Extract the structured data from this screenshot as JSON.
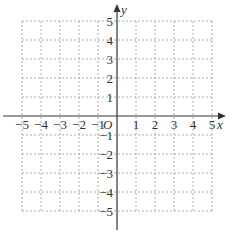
{
  "chart_data": {
    "type": "scatter",
    "title": "",
    "xlabel": "x",
    "ylabel": "y",
    "origin_label": "O",
    "xlim": [
      -5,
      5
    ],
    "ylim": [
      -5,
      5
    ],
    "grid": true,
    "grid_style": "dashed",
    "x_ticks": [
      "-5",
      "-4",
      "-3",
      "-2",
      "-1",
      "1",
      "2",
      "3",
      "4",
      "5"
    ],
    "y_ticks": [
      "5",
      "4",
      "3",
      "2",
      "1",
      "-1",
      "-2",
      "-3",
      "-4",
      "-5"
    ],
    "series": []
  },
  "colors": {
    "axis": "#333333",
    "grid": "#9a9a9a",
    "text": "#333333"
  }
}
